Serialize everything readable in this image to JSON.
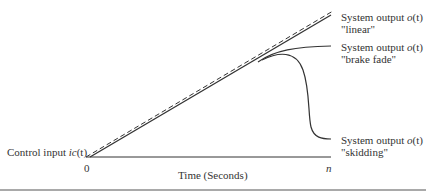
{
  "diagram": {
    "type": "line-schematic",
    "x_axis": {
      "label": "Time (Seconds)",
      "start_tick": "0",
      "end_tick": "n"
    },
    "input": {
      "label_prefix": "Control input ",
      "label_var": "ic",
      "label_arg": "(t)"
    },
    "outputs": [
      {
        "label_prefix": "System output ",
        "label_var": "o",
        "label_arg": "(t)",
        "mode": "\"linear\""
      },
      {
        "label_prefix": "System output ",
        "label_var": "o",
        "label_arg": "(t)",
        "mode": "\"brake fade\""
      },
      {
        "label_prefix": "System output ",
        "label_var": "o",
        "label_arg": "(t)",
        "mode": "\"skidding\""
      }
    ],
    "colors": {
      "line": "#333333",
      "background": "#ffffff"
    }
  }
}
